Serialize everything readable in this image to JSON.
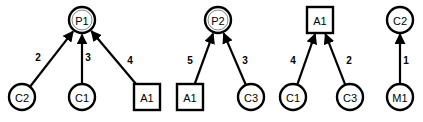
{
  "diagram": {
    "title": "",
    "graphs": [
      {
        "nodes": [
          {
            "id": "g1p1",
            "label": "P1",
            "shape": "double-circle",
            "x": 82,
            "y": 20
          },
          {
            "id": "g1c2",
            "label": "C2",
            "shape": "circle",
            "x": 22,
            "y": 97
          },
          {
            "id": "g1c1",
            "label": "C1",
            "shape": "circle",
            "x": 82,
            "y": 97
          },
          {
            "id": "g1a1",
            "label": "A1",
            "shape": "square",
            "x": 147,
            "y": 97
          }
        ],
        "edges": [
          {
            "from": "g1c2",
            "to": "g1p1",
            "label": "2",
            "lx": 38,
            "ly": 57
          },
          {
            "from": "g1c1",
            "to": "g1p1",
            "label": "3",
            "lx": 88,
            "ly": 57
          },
          {
            "from": "g1a1",
            "to": "g1p1",
            "label": "4",
            "lx": 130,
            "ly": 60
          }
        ]
      },
      {
        "nodes": [
          {
            "id": "g2p2",
            "label": "P2",
            "shape": "double-circle",
            "x": 218,
            "y": 20
          },
          {
            "id": "g2a1",
            "label": "A1",
            "shape": "square",
            "x": 190,
            "y": 97
          },
          {
            "id": "g2c3",
            "label": "C3",
            "shape": "circle",
            "x": 251,
            "y": 97
          }
        ],
        "edges": [
          {
            "from": "g2a1",
            "to": "g2p2",
            "label": "5",
            "lx": 190,
            "ly": 60
          },
          {
            "from": "g2c3",
            "to": "g2p2",
            "label": "3",
            "lx": 245,
            "ly": 60
          }
        ]
      },
      {
        "nodes": [
          {
            "id": "g3a1",
            "label": "A1",
            "shape": "square",
            "x": 320,
            "y": 20
          },
          {
            "id": "g3c1",
            "label": "C1",
            "shape": "circle",
            "x": 293,
            "y": 97
          },
          {
            "id": "g3c3",
            "label": "C3",
            "shape": "circle",
            "x": 350,
            "y": 97
          }
        ],
        "edges": [
          {
            "from": "g3c1",
            "to": "g3a1",
            "label": "4",
            "lx": 293,
            "ly": 60
          },
          {
            "from": "g3c3",
            "to": "g3a1",
            "label": "2",
            "lx": 349,
            "ly": 60
          }
        ]
      },
      {
        "nodes": [
          {
            "id": "g4c2",
            "label": "C2",
            "shape": "circle",
            "x": 400,
            "y": 20
          },
          {
            "id": "g4m1",
            "label": "M1",
            "shape": "circle",
            "x": 400,
            "y": 97
          }
        ],
        "edges": [
          {
            "from": "g4m1",
            "to": "g4c2",
            "label": "1",
            "lx": 406,
            "ly": 60
          }
        ]
      }
    ]
  }
}
